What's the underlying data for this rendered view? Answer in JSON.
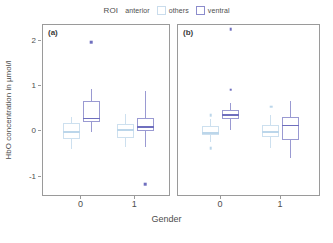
{
  "legend": {
    "title": "ROI",
    "pre_label": "anterior",
    "items": [
      {
        "label": "others",
        "color": "#cde0ef"
      },
      {
        "label": "ventral",
        "color": "#9a9ad2"
      }
    ]
  },
  "axes": {
    "ylabel": "HbO concentration in µmol/l",
    "xlabel": "Gender",
    "yticks": [
      "2",
      "1",
      "0",
      "-1"
    ],
    "xticks": [
      "0",
      "1"
    ]
  },
  "panels": [
    {
      "tag": "(a)"
    },
    {
      "tag": "(b)"
    }
  ],
  "chart_data": {
    "type": "box",
    "title": "",
    "xlabel": "Gender",
    "ylabel": "HbO concentration in µmol/l",
    "ylim": [
      -1.45,
      2.35
    ],
    "yticks": [
      2,
      1,
      0,
      -1
    ],
    "grid": false,
    "legend_title": "ROI",
    "legend_position": "top-center",
    "legend_entries": [
      "anterior",
      "others",
      "ventral"
    ],
    "facets": [
      {
        "label": "(a)",
        "groups": [
          {
            "x": "0",
            "boxes": [
              {
                "roi": "others",
                "color": "#cde0ef",
                "lower_whisker": -0.42,
                "q1": -0.19,
                "median": -0.03,
                "q3": 0.16,
                "upper_whisker": 0.3,
                "outliers": []
              },
              {
                "roi": "ventral",
                "color": "#9a9ad2",
                "lower_whisker": -0.04,
                "q1": 0.19,
                "median": 0.28,
                "q3": 0.66,
                "upper_whisker": 0.92,
                "outliers": [
                  1.97
                ]
              }
            ]
          },
          {
            "x": "1",
            "boxes": [
              {
                "roi": "others",
                "color": "#cde0ef",
                "lower_whisker": -0.38,
                "q1": -0.18,
                "median": 0.02,
                "q3": 0.13,
                "upper_whisker": 0.35,
                "outliers": []
              },
              {
                "roi": "ventral",
                "color": "#9a9ad2",
                "lower_whisker": -0.37,
                "q1": -0.03,
                "median": 0.09,
                "q3": 0.28,
                "upper_whisker": 0.87,
                "outliers": [
                  -1.21
                ]
              }
            ]
          }
        ]
      },
      {
        "label": "(b)",
        "groups": [
          {
            "x": "0",
            "boxes": [
              {
                "roi": "others",
                "color": "#cde0ef",
                "lower_whisker": -0.27,
                "q1": -0.12,
                "median": -0.04,
                "q3": 0.09,
                "upper_whisker": 0.24,
                "outliers": [
                  0.33,
                  -0.4
                ]
              },
              {
                "roi": "ventral",
                "color": "#9a9ad2",
                "lower_whisker": 0.01,
                "q1": 0.25,
                "median": 0.35,
                "q3": 0.44,
                "upper_whisker": 0.6,
                "outliers": [
                  0.9,
                  2.25
                ]
              }
            ]
          },
          {
            "x": "1",
            "boxes": [
              {
                "roi": "others",
                "color": "#cde0ef",
                "lower_whisker": -0.4,
                "q1": -0.16,
                "median": -0.03,
                "q3": 0.12,
                "upper_whisker": 0.33,
                "outliers": [
                  0.52
                ]
              },
              {
                "roi": "ventral",
                "color": "#9a9ad2",
                "lower_whisker": -0.62,
                "q1": -0.22,
                "median": 0.12,
                "q3": 0.3,
                "upper_whisker": 0.65,
                "outliers": []
              }
            ]
          }
        ]
      }
    ]
  }
}
